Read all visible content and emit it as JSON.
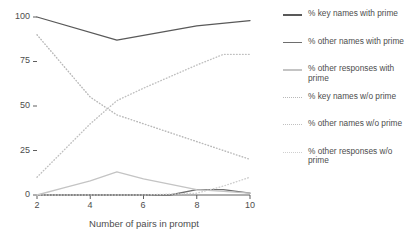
{
  "chart_data": {
    "type": "line",
    "title": "",
    "xlabel": "Number of pairs in prompt",
    "ylabel": "",
    "x": [
      2,
      4,
      5,
      6,
      8,
      9,
      10
    ],
    "xticks": [
      "2",
      "4",
      "6",
      "8",
      "10"
    ],
    "xtick_values": [
      2,
      4,
      6,
      8,
      10
    ],
    "yticks": [
      "0",
      "25",
      "50",
      "75",
      "100"
    ],
    "ytick_values": [
      0,
      25,
      50,
      75,
      100
    ],
    "xlim": [
      2,
      10
    ],
    "ylim": [
      0,
      100
    ],
    "grid": false,
    "legend_position": "right",
    "series": [
      {
        "name": "% key names with prime",
        "style": "solid",
        "color": "#595959",
        "x": [
          2,
          5,
          8,
          10
        ],
        "values": [
          100,
          87,
          95,
          98
        ]
      },
      {
        "name": "% other names with prime",
        "style": "solid",
        "color": "#6e6e6e",
        "x": [
          2,
          5,
          7,
          8,
          9,
          10
        ],
        "values": [
          0,
          0,
          0,
          3,
          3,
          1
        ]
      },
      {
        "name": "% other responses with prime",
        "style": "solid",
        "color": "#c4c4c4",
        "x": [
          2,
          3,
          4,
          5,
          6,
          8,
          10
        ],
        "values": [
          0,
          4,
          8,
          13,
          9,
          3,
          1
        ]
      },
      {
        "name": "% key names w/o prime",
        "style": "dotted",
        "color": "#b8b8b8",
        "x": [
          2,
          4,
          5,
          6,
          8,
          10
        ],
        "values": [
          90,
          55,
          45,
          40,
          30,
          20
        ]
      },
      {
        "name": "% other names w/o prime",
        "style": "dotted",
        "color": "#c0c0c0",
        "x": [
          2,
          4,
          5,
          6,
          8,
          9,
          10
        ],
        "values": [
          10,
          40,
          53,
          60,
          73,
          79,
          79
        ]
      },
      {
        "name": "% other responses w/o prime",
        "style": "dotted",
        "color": "#cfcfcf",
        "x": [
          2,
          6,
          8,
          9,
          10
        ],
        "values": [
          0,
          0,
          1,
          5,
          10
        ]
      }
    ]
  },
  "legend": {
    "items": [
      {
        "label": "% key names with prime",
        "style": "solid",
        "color": "#595959"
      },
      {
        "label": "% other names with prime",
        "style": "solid",
        "color": "#6e6e6e"
      },
      {
        "label": "% other responses with prime",
        "style": "solid",
        "color": "#c4c4c4"
      },
      {
        "label": "% key names w/o prime",
        "style": "dotted",
        "color": "#b8b8b8"
      },
      {
        "label": "% other names w/o prime",
        "style": "dotted",
        "color": "#c0c0c0"
      },
      {
        "label": "% other responses w/o prime",
        "style": "dotted",
        "color": "#cfcfcf"
      }
    ]
  },
  "axes": {
    "x_label": "Number of pairs in prompt",
    "y_tick_0": "0",
    "y_tick_25": "25",
    "y_tick_50": "50",
    "y_tick_75": "75",
    "y_tick_100": "100",
    "x_tick_2": "2",
    "x_tick_4": "4",
    "x_tick_6": "6",
    "x_tick_8": "8",
    "x_tick_10": "10"
  }
}
